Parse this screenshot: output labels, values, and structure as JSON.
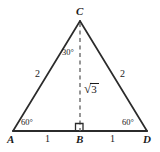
{
  "figure": {
    "kind": "geometry-diagram",
    "stroke_color": "#2b2b2b",
    "dash_color": "#6b6b6b",
    "background_color": "#ffffff"
  },
  "vertices": {
    "apex": {
      "label": "C",
      "x": 80,
      "y": 21
    },
    "left": {
      "label": "A",
      "x": 13,
      "y": 131
    },
    "foot": {
      "label": "B",
      "x": 80,
      "y": 131
    },
    "right": {
      "label": "D",
      "x": 147,
      "y": 131
    }
  },
  "sides": {
    "left_leg": "2",
    "right_leg": "2",
    "altitude_sign": "√",
    "altitude_value": "3"
  },
  "angles": {
    "apex_half": "30°",
    "left_base": "60°",
    "right_base": "60°",
    "right_angle_marker": "square"
  },
  "base_segments": {
    "left_half": "1",
    "right_half": "1"
  }
}
